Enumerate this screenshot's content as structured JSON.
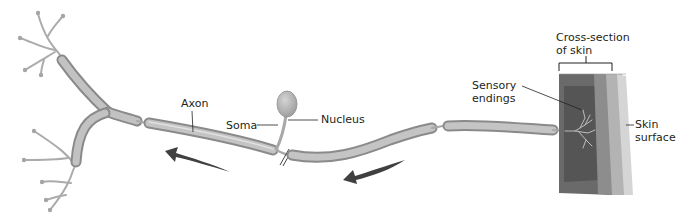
{
  "diagram": {
    "labels": {
      "axon": "Axon",
      "soma": "Soma",
      "nucleus": "Nucleus",
      "cross_section": "Cross-section\nof skin",
      "sensory_endings": "Sensory\nendings",
      "skin_surface": "Skin\nsurface"
    },
    "colors": {
      "fiber_fill": "#b5b5b5",
      "fiber_edge": "#8a8a8a",
      "fiber_highlight": "#d8d8d8",
      "dendrite": "#a9a9a9",
      "arrow": "#2a2a2a",
      "skin_dermis_dark": "#5a5a5a",
      "skin_mid": "#8f8f8f",
      "skin_light": "#b9b9b9",
      "skin_surface": "#d6d6d6",
      "text": "#231f20"
    },
    "arrows": [
      {
        "name": "signal-direction-arrow-left",
        "direction": "left"
      },
      {
        "name": "signal-direction-arrow-center",
        "direction": "left"
      }
    ]
  }
}
